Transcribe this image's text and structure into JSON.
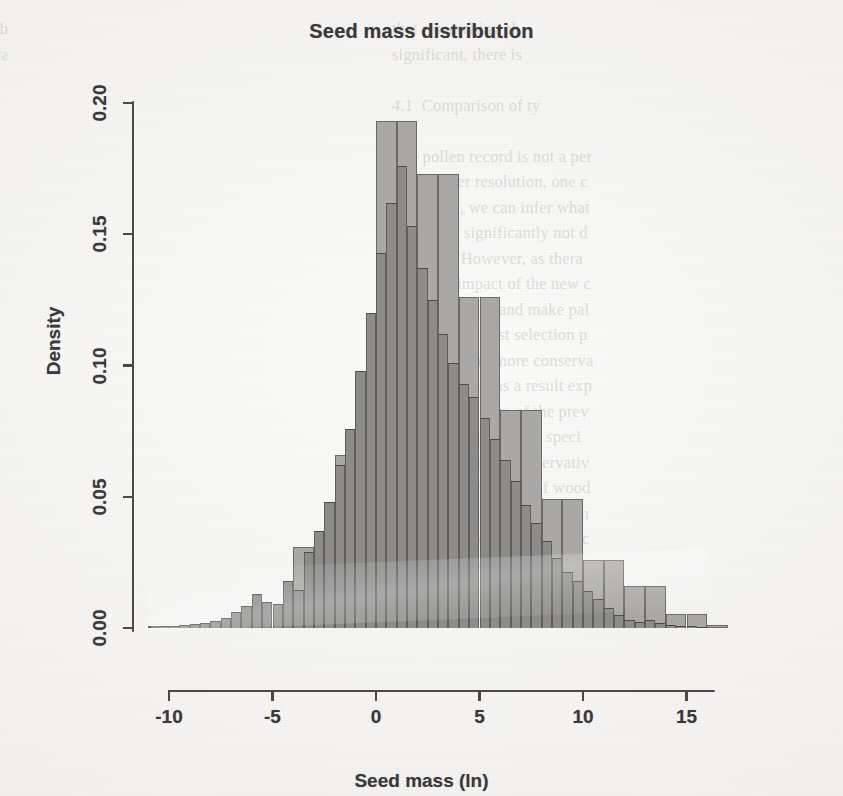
{
  "figure": {
    "title": "Seed mass distribution",
    "xlabel": "Seed mass (ln)",
    "ylabel": "Density"
  },
  "axes": {
    "x_ticks": [
      "-10",
      "-5",
      "0",
      "5",
      "10",
      "15"
    ],
    "y_ticks": [
      "0.00",
      "0.05",
      "0.10",
      "0.15",
      "0.20"
    ]
  },
  "background_text": {
    "left_column": "during Neogene, and more re\nsignificant in the Northern H",
    "right_column": "that researching ab\nsignificant, there is\n\n4.1  Comparison of ty\n\nThe pollen record is not a per\nwith a finer resolution, one c\nresolution, we can infer what\nthat could significantly not d\nNeogene. However, as thera\nshow the impact of the new c\nof the analysis, and make pal\nin 2013. The first selection p\nis a useful and more conserva\nthe Paleogene, as a result exp\nof the pollen data of the prev\ndifferent records were speci\nthe flora of more conservativ\nprobably a wider set of wood\nthese types decrease the num\nthe same. The records from c\nthat is, the flora and resolution\na modern selection of woody\nwould indicate the dominant"
  },
  "chart_data": {
    "type": "bar",
    "subtype": "overlapping-histogram",
    "title": "Seed mass distribution",
    "xlabel": "Seed mass (ln)",
    "ylabel": "Density",
    "xlim": [
      -11,
      16.5
    ],
    "ylim": [
      0.0,
      0.205
    ],
    "grid": false,
    "legend": "none",
    "series": [
      {
        "name": "wide-bin histogram (light gray)",
        "color": "#aaa8a6",
        "edge_color": "#6a6967",
        "bin_width": 1.0,
        "bin_starts": [
          -11,
          -10,
          -9,
          -8,
          -7,
          -6,
          -5,
          -4,
          -3,
          -2,
          -1,
          0,
          1,
          2,
          3,
          4,
          5,
          6,
          7,
          8,
          9,
          10,
          11,
          12,
          13,
          14,
          15,
          16
        ],
        "densities": [
          0.0005,
          0.0008,
          0.0012,
          0.0018,
          0.0025,
          0.0042,
          0.0075,
          0.031,
          0.031,
          0.066,
          0.066,
          0.193,
          0.193,
          0.173,
          0.173,
          0.126,
          0.126,
          0.083,
          0.083,
          0.049,
          0.049,
          0.026,
          0.026,
          0.016,
          0.016,
          0.0055,
          0.0055,
          0.001
        ]
      },
      {
        "name": "narrow-bin histogram (dark gray)",
        "color": "#8d8c8a",
        "edge_color": "#4b4a49",
        "bin_width": 0.5,
        "bin_starts": [
          -10.5,
          -10.0,
          -9.5,
          -9.0,
          -8.5,
          -8.0,
          -7.5,
          -7.0,
          -6.5,
          -6.0,
          -5.5,
          -5.0,
          -4.5,
          -4.0,
          -3.5,
          -3.0,
          -2.5,
          -2.0,
          -1.5,
          -1.0,
          -0.5,
          0.0,
          0.5,
          1.0,
          1.5,
          2.0,
          2.5,
          3.0,
          3.5,
          4.0,
          4.5,
          5.0,
          5.5,
          6.0,
          6.5,
          7.0,
          7.5,
          8.0,
          8.5,
          9.0,
          9.5,
          10.0,
          10.5,
          11.0,
          11.5,
          12.0,
          12.5,
          13.0,
          13.5,
          14.0,
          14.5,
          15.0,
          15.5
        ],
        "densities": [
          0.0006,
          0.0008,
          0.001,
          0.0014,
          0.002,
          0.0028,
          0.004,
          0.006,
          0.0085,
          0.013,
          0.01,
          0.009,
          0.018,
          0.0145,
          0.029,
          0.037,
          0.048,
          0.062,
          0.076,
          0.098,
          0.12,
          0.143,
          0.162,
          0.176,
          0.153,
          0.137,
          0.125,
          0.112,
          0.101,
          0.093,
          0.088,
          0.08,
          0.072,
          0.064,
          0.056,
          0.047,
          0.04,
          0.033,
          0.0265,
          0.0215,
          0.018,
          0.014,
          0.011,
          0.0075,
          0.0048,
          0.0032,
          0.0022,
          0.003,
          0.0018,
          0.0012,
          0.0009,
          0.0006,
          0.0003
        ]
      }
    ]
  }
}
